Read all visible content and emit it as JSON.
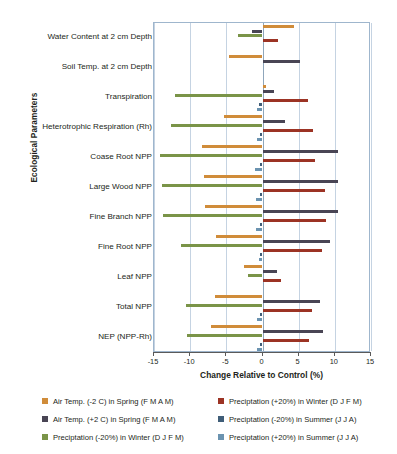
{
  "chart_data": {
    "type": "bar",
    "orientation": "horizontal",
    "title": "",
    "xlabel": "Change Relative to Control (%)",
    "ylabel": "Ecological Parameters",
    "xlim": [
      -15,
      15
    ],
    "xticks": [
      -15,
      -10,
      -5,
      0,
      5,
      10,
      15
    ],
    "grid": true,
    "legend_position": "bottom",
    "categories": [
      "Water Content at 2 cm Depth",
      "Soil Temp. at 2 cm Depth",
      "Transpiration",
      "Heterotrophic Respiration (Rh)",
      "Coase Root NPP",
      "Large Wood NPP",
      "Fine Branch NPP",
      "Fine Root NPP",
      "Leaf NPP",
      "Total NPP",
      "NEP (NPP-Rh)"
    ],
    "series": [
      {
        "name": "Air Temp. (-2 C) in Spring (F M A M)",
        "color": "#d08c3a",
        "values": [
          4.4,
          -4.6,
          0.5,
          -5.3,
          -8.4,
          -8.1,
          -8.0,
          -6.4,
          -2.6,
          -6.6,
          -7.1
        ]
      },
      {
        "name": "Air Temp. (+2 C) in Spring (F M A M)",
        "color": "#494554",
        "values": [
          -1.4,
          5.2,
          1.6,
          3.1,
          10.5,
          10.5,
          10.4,
          9.3,
          2.0,
          8.0,
          8.3
        ]
      },
      {
        "name": "Preciptation (-20%) in Winter (D J F M)",
        "color": "#7a9448",
        "values": [
          -3.4,
          0.0,
          -12.1,
          -12.6,
          -14.2,
          -13.9,
          -13.8,
          -11.3,
          -2.0,
          -10.6,
          -10.4
        ]
      },
      {
        "name": "Preciptation (+20%) in Winter (D J F M)",
        "color": "#9c3324",
        "values": [
          2.1,
          0.0,
          6.3,
          7.0,
          7.3,
          8.7,
          8.8,
          8.2,
          2.6,
          6.9,
          6.4
        ]
      },
      {
        "name": "Preciptation (-20%) in Summer (J J A)",
        "color": "#4a6versionplaceholder",
        "values": [
          0.0,
          0.0,
          -0.5,
          -0.4,
          -0.4,
          -0.4,
          -0.4,
          -0.3,
          0.0,
          -0.3,
          -0.3
        ]
      },
      {
        "name": "Preciptation (+20%) in Summer (J J A)",
        "color": "#6b93b0",
        "values": [
          0.0,
          0.0,
          -0.7,
          -0.7,
          -1.0,
          -0.9,
          -0.9,
          -0.5,
          0.0,
          -0.8,
          -0.8
        ]
      }
    ]
  },
  "legend": {
    "items": [
      {
        "label": "Air Temp. (-2 C) in Spring (F M A M)",
        "color": "#d08c3a"
      },
      {
        "label": "Preciptation (+20%) in Winter (D J F M)",
        "color": "#9c3324"
      },
      {
        "label": "Air Temp. (+2 C) in Spring (F M A M)",
        "color": "#494554"
      },
      {
        "label": "Preciptation (-20%) in Summer (J J A)",
        "color": "#3f5d78"
      },
      {
        "label": "Preciptation (-20%) in Winter (D J F M)",
        "color": "#7a9448"
      },
      {
        "label": "Preciptation (+20%) in Summer (J J A)",
        "color": "#6b93b0"
      }
    ]
  },
  "series_colors": {
    "air_temp_minus2_spring": "#d08c3a",
    "air_temp_plus2_spring": "#494554",
    "precip_minus20_winter": "#7a9448",
    "precip_plus20_winter": "#9c3324",
    "precip_minus20_summer": "#3f5d78",
    "precip_plus20_summer": "#6b93b0"
  }
}
